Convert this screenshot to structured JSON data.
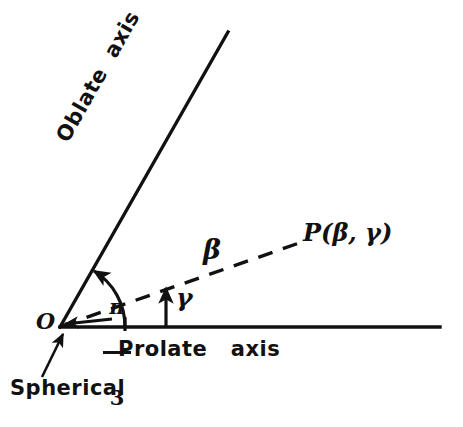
{
  "figure": {
    "background_color": "#ffffff",
    "ink_color": "#111111",
    "width": 463,
    "height": 427
  },
  "labels": {
    "oblate_axis": "Oblate  axis",
    "prolate_axis": "Prolate   axis",
    "spherical": "Spherical",
    "origin": "O",
    "beta": "β",
    "gamma": "γ",
    "point_p": "P(β, γ)",
    "angle_numerator": "π",
    "angle_denominator": "3",
    "angle_full": "π/3"
  },
  "geometry": {
    "origin": {
      "x": 60,
      "y": 327
    },
    "prolate_axis": {
      "from": {
        "x": 60,
        "y": 327
      },
      "to": {
        "x": 440,
        "y": 327
      },
      "style": "solid",
      "angle_deg": 0
    },
    "oblate_axis": {
      "from": {
        "x": 60,
        "y": 327
      },
      "to": {
        "x": 228,
        "y": 32
      },
      "style": "solid",
      "angle_deg": 60.4
    },
    "beta_ray": {
      "from": {
        "x": 60,
        "y": 327
      },
      "to": {
        "x": 302,
        "y": 242
      },
      "style": "dashed",
      "angle_deg": 19.3
    },
    "pi_over_3_arc": {
      "radius": 65,
      "from_angle_deg": 0,
      "to_angle_deg": 60.4,
      "arrow_at": "oblate-axis-end"
    },
    "gamma_arrow": {
      "from": {
        "x": 166,
        "y": 327
      },
      "to": {
        "x": 166,
        "y": 287
      },
      "arrow_at": "top"
    },
    "spherical_leader": {
      "from": {
        "x": 43,
        "y": 376
      },
      "to": {
        "x": 63,
        "y": 333
      },
      "arrow_at": "end"
    },
    "origin_pointer": {
      "from": {
        "x": 118,
        "y": 322
      },
      "to": {
        "x": 64,
        "y": 326
      },
      "arrow_at": "end"
    }
  }
}
